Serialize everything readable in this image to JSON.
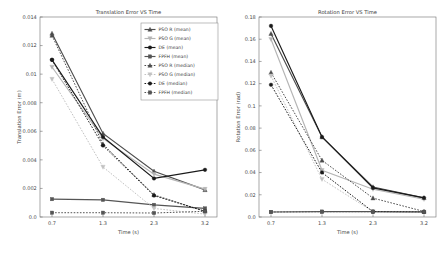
{
  "figure": {
    "background": "#ffffff",
    "panels": [
      "translation",
      "rotation"
    ]
  },
  "colors": {
    "pso_r_mean": "#4d4d4d",
    "pso_g_mean": "#b5b5b5",
    "de_mean": "#1a1a1a",
    "fpfh_mean": "#555555",
    "pso_r_median": "#4d4d4d",
    "pso_g_median": "#c2c2c2",
    "de_median": "#1a1a1a",
    "fpfh_median": "#555555",
    "axis": "#6f6f6f",
    "text": "#3a3a3a"
  },
  "legend": {
    "position": "upper right",
    "entries": [
      {
        "label": "PSO R (mean)",
        "marker": "triangle-up",
        "style": "solid",
        "color": "#4d4d4d"
      },
      {
        "label": "PSO G (mean)",
        "marker": "triangle-down",
        "style": "solid",
        "color": "#b5b5b5"
      },
      {
        "label": "DE (mean)",
        "marker": "circle",
        "style": "solid",
        "color": "#1a1a1a"
      },
      {
        "label": "FPFH (mean)",
        "marker": "square",
        "style": "solid",
        "color": "#555555"
      },
      {
        "label": "PSO R (median)",
        "marker": "triangle-up",
        "style": "dashed",
        "color": "#4d4d4d"
      },
      {
        "label": "PSO G (median)",
        "marker": "triangle-down",
        "style": "dashed",
        "color": "#c2c2c2"
      },
      {
        "label": "DE (median)",
        "marker": "circle",
        "style": "dashed",
        "color": "#1a1a1a"
      },
      {
        "label": "FPFH (median)",
        "marker": "square",
        "style": "dashed",
        "color": "#555555"
      }
    ]
  },
  "chart_data": [
    {
      "id": "translation",
      "type": "line",
      "title": "Translation Error VS Time",
      "xlabel": "Time (s)",
      "ylabel": "Translation Error (m)",
      "x": [
        0.7,
        1.3,
        2.3,
        3.2
      ],
      "xtick_labels": [
        "0.7",
        "1.3",
        "2.3",
        "3.2"
      ],
      "ytick_labels": [
        "0.0",
        "0.002",
        "0.004",
        "0.006",
        "0.008",
        "0.01",
        "0.012",
        "0.014"
      ],
      "yticks": [
        0.0,
        0.002,
        0.004,
        0.006,
        0.008,
        0.01,
        0.012,
        0.014
      ],
      "ylim": [
        0.0,
        0.014
      ],
      "grid": false,
      "series": [
        {
          "name": "PSO R (mean)",
          "style": "solid",
          "marker": "triangle-up",
          "color": "#4d4d4d",
          "values": [
            0.01285,
            0.00585,
            0.0032,
            0.0019
          ]
        },
        {
          "name": "PSO G (mean)",
          "style": "solid",
          "marker": "triangle-down",
          "color": "#b5b5b5",
          "values": [
            0.0105,
            0.0055,
            0.003,
            0.00195
          ]
        },
        {
          "name": "DE (mean)",
          "style": "solid",
          "marker": "circle",
          "color": "#1a1a1a",
          "values": [
            0.011,
            0.0056,
            0.0027,
            0.0033
          ]
        },
        {
          "name": "FPFH (mean)",
          "style": "solid",
          "marker": "square",
          "color": "#555555",
          "values": [
            0.00125,
            0.0012,
            0.00085,
            0.0006
          ]
        },
        {
          "name": "PSO R (median)",
          "style": "dashed",
          "marker": "triangle-up",
          "color": "#4d4d4d",
          "values": [
            0.0127,
            0.0051,
            0.00155,
            0.0004
          ]
        },
        {
          "name": "PSO G (median)",
          "style": "dashed",
          "marker": "triangle-down",
          "color": "#c2c2c2",
          "values": [
            0.00965,
            0.0035,
            0.0006,
            0.0002
          ]
        },
        {
          "name": "DE (median)",
          "style": "dashed",
          "marker": "circle",
          "color": "#1a1a1a",
          "values": [
            0.011,
            0.005,
            0.0015,
            0.0004
          ]
        },
        {
          "name": "FPFH (median)",
          "style": "dashed",
          "marker": "square",
          "color": "#555555",
          "values": [
            0.0003,
            0.0003,
            0.00028,
            0.0004
          ]
        }
      ]
    },
    {
      "id": "rotation",
      "type": "line",
      "title": "Rotation Error VS Time",
      "xlabel": "Time (s)",
      "ylabel": "Rotation Error (rad)",
      "x": [
        0.7,
        1.3,
        2.3,
        3.2
      ],
      "xtick_labels": [
        "0.7",
        "1.3",
        "2.3",
        "3.2"
      ],
      "ytick_labels": [
        "0.0",
        "0.02",
        "0.04",
        "0.06",
        "0.08",
        "0.1",
        "0.12",
        "0.14",
        "0.16",
        "0.18"
      ],
      "yticks": [
        0.0,
        0.02,
        0.04,
        0.06,
        0.08,
        0.1,
        0.12,
        0.14,
        0.16,
        0.18
      ],
      "ylim": [
        0.0,
        0.18
      ],
      "grid": false,
      "series": [
        {
          "name": "PSO R (mean)",
          "style": "solid",
          "marker": "triangle-up",
          "color": "#4d4d4d",
          "values": [
            0.165,
            0.072,
            0.027,
            0.0172
          ]
        },
        {
          "name": "PSO G (mean)",
          "style": "solid",
          "marker": "triangle-down",
          "color": "#b5b5b5",
          "values": [
            0.16,
            0.042,
            0.025,
            0.016
          ]
        },
        {
          "name": "DE (mean)",
          "style": "solid",
          "marker": "circle",
          "color": "#1a1a1a",
          "values": [
            0.172,
            0.072,
            0.0262,
            0.0172
          ]
        },
        {
          "name": "FPFH (mean)",
          "style": "solid",
          "marker": "square",
          "color": "#555555",
          "values": [
            0.0045,
            0.0048,
            0.0048,
            0.0046
          ]
        },
        {
          "name": "PSO R (median)",
          "style": "dashed",
          "marker": "triangle-up",
          "color": "#4d4d4d",
          "values": [
            0.13,
            0.051,
            0.017,
            0.005
          ]
        },
        {
          "name": "PSO G (median)",
          "style": "dashed",
          "marker": "triangle-down",
          "color": "#c2c2c2",
          "values": [
            0.127,
            0.034,
            0.0048,
            0.0046
          ]
        },
        {
          "name": "DE (median)",
          "style": "dashed",
          "marker": "circle",
          "color": "#1a1a1a",
          "values": [
            0.119,
            0.04,
            0.0048,
            0.0046
          ]
        },
        {
          "name": "FPFH (median)",
          "style": "dashed",
          "marker": "square",
          "color": "#555555",
          "values": [
            0.0045,
            0.0048,
            0.0048,
            0.0046
          ]
        }
      ]
    }
  ]
}
